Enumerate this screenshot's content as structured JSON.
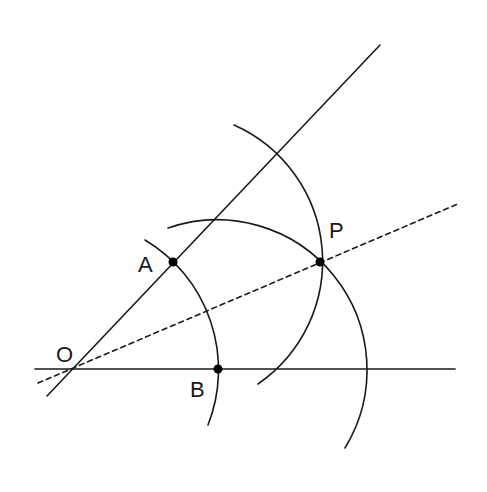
{
  "diagram": {
    "labels": {
      "O": "O",
      "A": "A",
      "B": "B",
      "P": "P"
    },
    "colors": {
      "stroke": "#1a1a1a",
      "background": "#ffffff"
    }
  }
}
